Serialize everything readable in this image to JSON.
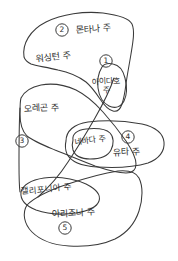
{
  "map": {
    "title": "서부 미국 주 손그림 지도",
    "ink_color": "#3a3a3a",
    "background_color": "#ffffff",
    "states": [
      {
        "id": "montana",
        "label": "몬타나 주",
        "marker": "2",
        "outline_name": "montana-washington-outline"
      },
      {
        "id": "washington",
        "label": "워싱턴 주",
        "marker": "",
        "outline_name": "washington-outline"
      },
      {
        "id": "idaho",
        "label": "아이다호 주",
        "marker": "1",
        "outline_name": "idaho-outline"
      },
      {
        "id": "oregon",
        "label": "오레곤 주",
        "marker": "3",
        "outline_name": "oregon-outline"
      },
      {
        "id": "nevada",
        "label": "네바다 주",
        "marker": "",
        "outline_name": "nevada-outline"
      },
      {
        "id": "utah",
        "label": "유타 주",
        "marker": "4",
        "outline_name": "utah-outline"
      },
      {
        "id": "california",
        "label": "캘리포니아 주",
        "marker": "",
        "outline_name": "california-outline"
      },
      {
        "id": "arizona",
        "label": "아리조나 주",
        "marker": "5",
        "outline_name": "arizona-outline"
      }
    ],
    "markers": [
      {
        "number": "1",
        "state": "아이다호 주"
      },
      {
        "number": "2",
        "state": "몬타나 주"
      },
      {
        "number": "3",
        "state": "오레곤 주"
      },
      {
        "number": "4",
        "state": "유타 주"
      },
      {
        "number": "5",
        "state": "아리조나 주"
      }
    ]
  }
}
